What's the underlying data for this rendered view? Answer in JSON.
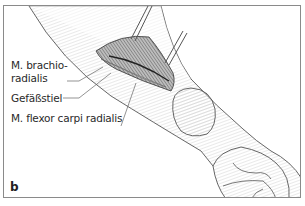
{
  "figure": {
    "panel_letter": "b",
    "labels": [
      {
        "id": "brachioradialis",
        "line1": "M. brachio-",
        "line2": "radialis"
      },
      {
        "id": "gefaessstiel",
        "text": "Gefäßstiel"
      },
      {
        "id": "flexor",
        "text": "M. flexor carpi radialis"
      }
    ]
  }
}
